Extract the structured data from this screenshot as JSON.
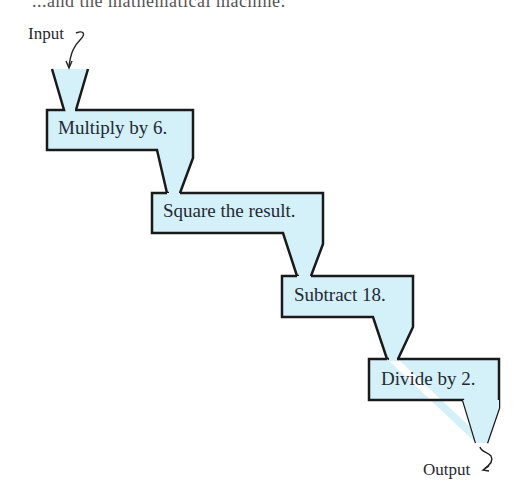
{
  "diagram": {
    "type": "function-machine-flow",
    "top_text_partial": "...and the mathematical machine:",
    "input_label": "Input",
    "output_label": "Output",
    "steps": [
      {
        "label": "Multiply by 6."
      },
      {
        "label": "Square the result."
      },
      {
        "label": "Subtract 18."
      },
      {
        "label": "Divide by 2."
      }
    ],
    "colors": {
      "fill": "#d4f0f8",
      "stroke": "#1a1a1a",
      "text": "#1f2a33"
    }
  }
}
